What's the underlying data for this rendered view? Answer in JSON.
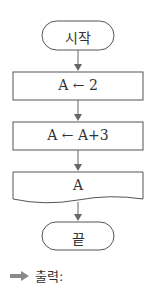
{
  "flowchart": {
    "start": "시작",
    "step1": "A ← 2",
    "step2": "A ← A+3",
    "output": "A",
    "end": "끝"
  },
  "answer": {
    "label": "출력:",
    "icon": "arrow-right-icon"
  },
  "colors": {
    "stroke": "#555555",
    "arrow": "#9a9a9a"
  }
}
